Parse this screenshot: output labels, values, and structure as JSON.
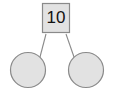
{
  "diagram": {
    "type": "binary-tree",
    "background_color": "#ffffff",
    "node_fill_color": "#e2e2e2",
    "node_stroke_color": "#8a8a8a",
    "edge_color": "#8a8a8a",
    "label_color": "#111111",
    "root": {
      "shape": "square",
      "label": "10",
      "x": 56,
      "y": 18,
      "width": 28,
      "height": 30
    },
    "children": [
      {
        "shape": "circle",
        "label": "",
        "position": "left",
        "cx": 28,
        "cy": 70,
        "r": 18
      },
      {
        "shape": "circle",
        "label": "",
        "position": "right",
        "cx": 86,
        "cy": 70,
        "r": 18
      }
    ],
    "edges": [
      {
        "from": "root",
        "to": "left-child",
        "x1": 46,
        "y1": 34,
        "x2": 40,
        "y2": 57
      },
      {
        "from": "root",
        "to": "right-child",
        "x1": 66,
        "y1": 34,
        "x2": 74,
        "y2": 57
      }
    ]
  }
}
